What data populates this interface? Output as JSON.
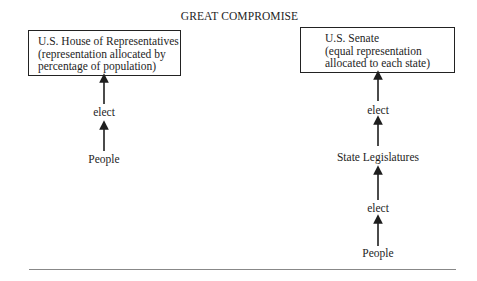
{
  "title": "GREAT COMPROMISE",
  "house": {
    "box_lines": [
      "U.S. House of Representatives",
      "(representation allocated by",
      "percentage of population)"
    ],
    "elect_label": "elect",
    "people_label": "People"
  },
  "senate": {
    "box_lines": [
      "U.S. Senate",
      "(equal representation",
      "allocated to each state)"
    ],
    "elect_label_1": "elect",
    "state_legislatures_label": "State Legislatures",
    "elect_label_2": "elect",
    "people_label": "People"
  },
  "colors": {
    "ink": "#1e1e1e",
    "rule": "#888888",
    "background": "#ffffff"
  }
}
